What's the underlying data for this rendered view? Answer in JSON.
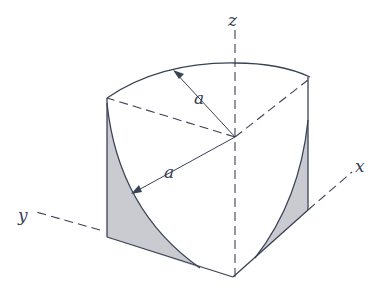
{
  "diagram": {
    "axes": {
      "x": "x",
      "y": "y",
      "z": "z"
    },
    "radius_labels": [
      "a",
      "a"
    ],
    "colors": {
      "stroke": "#3a4256",
      "shade": "#c9cbd1"
    }
  }
}
